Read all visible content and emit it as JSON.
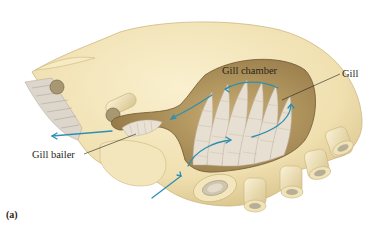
{
  "figure": {
    "panel_label": "(a)",
    "labels": {
      "gill_chamber": "Gill chamber",
      "gill": "Gill",
      "gill_bailer": "Gill bailer"
    },
    "colors": {
      "carapace": "#f2e4b8",
      "carapace_shadow": "#d9c48e",
      "chamber": "#b89a62",
      "chamber_dark": "#8f7444",
      "gill": "#e4ddd0",
      "gill_stripe": "#b9ad98",
      "water_flow_arrow": "#2f8fb0",
      "leader_line": "#222222",
      "background": "#ffffff"
    },
    "arrows": [
      {
        "name": "inflow-arrow",
        "direction": "into chamber from below"
      },
      {
        "name": "circulation-arrows",
        "direction": "over gills"
      },
      {
        "name": "outflow-arrow",
        "direction": "out anteriorly (left)"
      }
    ]
  }
}
